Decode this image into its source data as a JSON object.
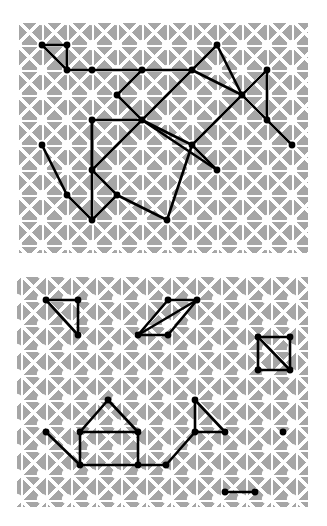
{
  "figure": {
    "type": "diagram",
    "background_color": "#ffffff",
    "panel_fill": "#a6a6a6",
    "lattice_color": "#ffffff",
    "graph_color": "#000000",
    "node_color": "#000000"
  },
  "lattice": {
    "spacing": 25,
    "cols": 9,
    "rows": 7,
    "origin_x": 20,
    "origin_y": 20,
    "motif": "square-grid-with-both-diagonals"
  },
  "panels": [
    {
      "name": "panel-top",
      "label": "top-panel",
      "rect": {
        "x": 17,
        "y": 23,
        "w": 291,
        "h": 230
      },
      "lattice_origin": {
        "x": 42,
        "y": 45
      },
      "nodes": [
        {
          "id": "a0",
          "x": 42,
          "y": 45
        },
        {
          "id": "a1",
          "x": 67,
          "y": 45
        },
        {
          "id": "a2",
          "x": 67,
          "y": 70
        },
        {
          "id": "a3",
          "x": 92,
          "y": 70
        },
        {
          "id": "a4",
          "x": 217,
          "y": 45
        },
        {
          "id": "a5",
          "x": 142,
          "y": 70
        },
        {
          "id": "a6",
          "x": 192,
          "y": 70
        },
        {
          "id": "a7",
          "x": 267,
          "y": 70
        },
        {
          "id": "a8",
          "x": 117,
          "y": 95
        },
        {
          "id": "a9",
          "x": 242,
          "y": 95
        },
        {
          "id": "a10",
          "x": 142,
          "y": 120
        },
        {
          "id": "a11",
          "x": 267,
          "y": 120
        },
        {
          "id": "a12",
          "x": 92,
          "y": 120
        },
        {
          "id": "a13",
          "x": 42,
          "y": 145
        },
        {
          "id": "a14",
          "x": 192,
          "y": 145
        },
        {
          "id": "a15",
          "x": 217,
          "y": 170
        },
        {
          "id": "a16",
          "x": 92,
          "y": 170
        },
        {
          "id": "a17",
          "x": 117,
          "y": 195
        },
        {
          "id": "a18",
          "x": 67,
          "y": 195
        },
        {
          "id": "a19",
          "x": 92,
          "y": 220
        },
        {
          "id": "a20",
          "x": 167,
          "y": 220
        },
        {
          "id": "a21",
          "x": 292,
          "y": 145
        }
      ],
      "edges": [
        [
          "a0",
          "a1"
        ],
        [
          "a0",
          "a2"
        ],
        [
          "a1",
          "a2"
        ],
        [
          "a2",
          "a3"
        ],
        [
          "a3",
          "a5"
        ],
        [
          "a5",
          "a8"
        ],
        [
          "a8",
          "a10"
        ],
        [
          "a10",
          "a12"
        ],
        [
          "a12",
          "a16"
        ],
        [
          "a16",
          "a17"
        ],
        [
          "a17",
          "a19"
        ],
        [
          "a19",
          "a18"
        ],
        [
          "a18",
          "a13"
        ],
        [
          "a16",
          "a12"
        ],
        [
          "a16",
          "a19"
        ],
        [
          "a5",
          "a6"
        ],
        [
          "a6",
          "a4"
        ],
        [
          "a4",
          "a9"
        ],
        [
          "a9",
          "a6"
        ],
        [
          "a9",
          "a7"
        ],
        [
          "a7",
          "a11"
        ],
        [
          "a9",
          "a11"
        ],
        [
          "a11",
          "a21"
        ],
        [
          "a6",
          "a10"
        ],
        [
          "a10",
          "a14"
        ],
        [
          "a14",
          "a9"
        ],
        [
          "a14",
          "a15"
        ],
        [
          "a15",
          "a10"
        ],
        [
          "a17",
          "a20"
        ],
        [
          "a20",
          "a14"
        ],
        [
          "a16",
          "a10"
        ]
      ]
    },
    {
      "name": "panel-bottom",
      "label": "bottom-panel",
      "rect": {
        "x": 17,
        "y": 277,
        "w": 291,
        "h": 230
      },
      "lattice_origin": {
        "x": 42,
        "y": 299
      },
      "nodes": [
        {
          "id": "b0",
          "x": 46,
          "y": 300
        },
        {
          "id": "b1",
          "x": 78,
          "y": 300
        },
        {
          "id": "b2",
          "x": 78,
          "y": 335
        },
        {
          "id": "b3",
          "x": 138,
          "y": 335
        },
        {
          "id": "b4",
          "x": 168,
          "y": 300
        },
        {
          "id": "b5",
          "x": 197,
          "y": 300
        },
        {
          "id": "b6",
          "x": 168,
          "y": 335
        },
        {
          "id": "b7",
          "x": 258,
          "y": 337
        },
        {
          "id": "b8",
          "x": 290,
          "y": 337
        },
        {
          "id": "b9",
          "x": 258,
          "y": 370
        },
        {
          "id": "b10",
          "x": 290,
          "y": 370
        },
        {
          "id": "b11",
          "x": 108,
          "y": 400
        },
        {
          "id": "b12",
          "x": 80,
          "y": 432
        },
        {
          "id": "b13",
          "x": 138,
          "y": 432
        },
        {
          "id": "b14",
          "x": 138,
          "y": 465
        },
        {
          "id": "b15",
          "x": 80,
          "y": 465
        },
        {
          "id": "b16",
          "x": 46,
          "y": 432
        },
        {
          "id": "b17",
          "x": 166,
          "y": 465
        },
        {
          "id": "b18",
          "x": 195,
          "y": 432
        },
        {
          "id": "b19",
          "x": 195,
          "y": 400
        },
        {
          "id": "b20",
          "x": 225,
          "y": 432
        },
        {
          "id": "b21",
          "x": 283,
          "y": 432
        },
        {
          "id": "b22",
          "x": 225,
          "y": 492
        },
        {
          "id": "b23",
          "x": 255,
          "y": 492
        }
      ],
      "edges": [
        [
          "b0",
          "b1"
        ],
        [
          "b0",
          "b2"
        ],
        [
          "b1",
          "b2"
        ],
        [
          "b3",
          "b4"
        ],
        [
          "b4",
          "b5"
        ],
        [
          "b5",
          "b6"
        ],
        [
          "b6",
          "b3"
        ],
        [
          "b3",
          "b5"
        ],
        [
          "b7",
          "b8"
        ],
        [
          "b8",
          "b10"
        ],
        [
          "b9",
          "b10"
        ],
        [
          "b7",
          "b9"
        ],
        [
          "b7",
          "b10"
        ],
        [
          "b11",
          "b12"
        ],
        [
          "b11",
          "b13"
        ],
        [
          "b12",
          "b13"
        ],
        [
          "b13",
          "b14"
        ],
        [
          "b12",
          "b15"
        ],
        [
          "b15",
          "b16"
        ],
        [
          "b15",
          "b14"
        ],
        [
          "b14",
          "b17"
        ],
        [
          "b17",
          "b18"
        ],
        [
          "b18",
          "b19"
        ],
        [
          "b19",
          "b20"
        ],
        [
          "b18",
          "b20"
        ],
        [
          "b22",
          "b23"
        ]
      ],
      "isolated_nodes": [
        "b21"
      ]
    }
  ]
}
